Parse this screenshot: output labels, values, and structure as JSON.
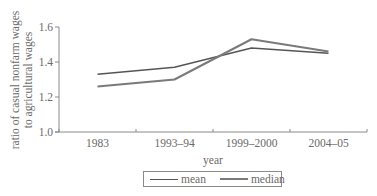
{
  "chart_data": {
    "type": "line",
    "title": "",
    "xlabel": "year",
    "ylabel": "ratio of casual nonfarm wages to agricultural wages",
    "ylabel_lines": [
      "ratio of casual nonfarm wages",
      "to agricultural wages"
    ],
    "categories": [
      "1983",
      "1993–94",
      "1999–2000",
      "2004–05"
    ],
    "series": [
      {
        "name": "mean",
        "values": [
          1.33,
          1.37,
          1.48,
          1.45
        ],
        "color": "#555555"
      },
      {
        "name": "median",
        "values": [
          1.26,
          1.3,
          1.53,
          1.46
        ],
        "color": "#7a7a7a"
      }
    ],
    "ylim": [
      1.0,
      1.6
    ],
    "yticks": [
      "1.0",
      "1.2",
      "1.4",
      "1.6"
    ],
    "grid": false,
    "legend_position": "bottom"
  },
  "legend": {
    "items": [
      {
        "label": "mean"
      },
      {
        "label": "median"
      }
    ]
  }
}
